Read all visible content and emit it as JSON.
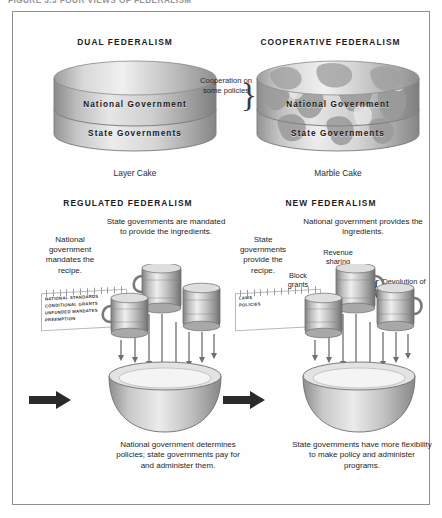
{
  "figure": {
    "title": "FIGURE 3.3  FOUR VIEWS OF FEDERALISM"
  },
  "panels": {
    "dual": {
      "header": "DUAL FEDERALISM",
      "cake_top_label": "National Government",
      "cake_bottom_label": "State Governments",
      "caption": "Layer Cake"
    },
    "cooperative": {
      "header": "COOPERATIVE FEDERALISM",
      "cake_top_label": "National Government",
      "cake_bottom_label": "State Governments",
      "caption": "Marble Cake",
      "callout": "Cooperation on some policies",
      "brace_glyph": "}"
    },
    "regulated": {
      "header": "REGULATED FEDERALISM",
      "left_note": "National government mandates the recipe.",
      "right_note": "State governments are mandated to provide the ingredients.",
      "card_items": [
        "NATIONAL STANDARDS",
        "CONDITIONAL GRANTS",
        "UNFUNDED MANDATES",
        "PREEMPTION"
      ],
      "conclusion": "National government determines policies; state governments pay for and administer them."
    },
    "new": {
      "header": "NEW FEDERALISM",
      "left_note": "State governments provide the recipe.",
      "right_note": "National government provides the ingredients.",
      "card_items": [
        "LAWS",
        "POLICIES"
      ],
      "label_revenue": "Revenue sharing",
      "label_block": "Block grants",
      "label_devolution": "Devolution of power",
      "brace_glyph": "{",
      "conclusion": "State governments have more flexibility to make policy and administer programs."
    }
  },
  "icons": {
    "measuring_cup": "measuring-cup-icon",
    "mixing_bowl": "mixing-bowl-icon",
    "pour_arrow": "pour-arrow-icon",
    "process_arrow": "process-arrow-icon",
    "recipe_card": "recipe-card-icon",
    "layer_cake": "layer-cake-icon",
    "marble_cake": "marble-cake-icon"
  },
  "colors": {
    "border": "#8e8e93",
    "text": "#231f20",
    "cake_light": "#e9e9e9",
    "cake_mid": "#bdbdbd",
    "cake_dark": "#8c8c8c",
    "marble_blotch": "#9a9a9a",
    "arrow": "#6e6e73"
  }
}
